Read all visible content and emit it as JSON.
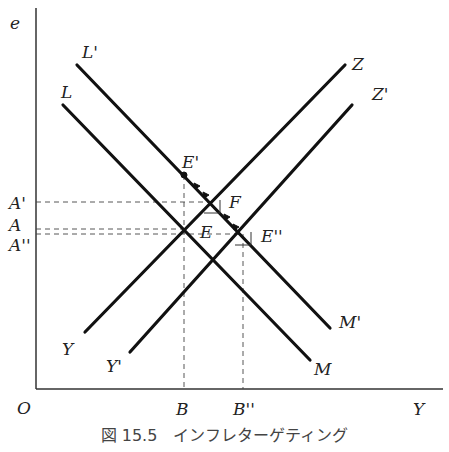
{
  "figure": {
    "caption": "図 15.5　インフレターゲティング",
    "axes": {
      "y_label": "e",
      "x_label": "Y",
      "origin_label": "O"
    },
    "curves": [
      {
        "name": "L",
        "label": "L",
        "end_label": "M",
        "kind": "downward-sloping"
      },
      {
        "name": "L'",
        "label": "L'",
        "end_label": "M'",
        "kind": "downward-sloping"
      },
      {
        "name": "Z",
        "label": "Z",
        "end_label": "Y",
        "kind": "upward-sloping"
      },
      {
        "name": "Z'",
        "label": "Z'",
        "end_label": "Y'",
        "kind": "upward-sloping"
      }
    ],
    "points": {
      "E": "E",
      "E_prime": "E'",
      "F": "F",
      "E_double_prime": "E''"
    },
    "y_ticks": {
      "A_prime": "A'",
      "A": "A",
      "A_double_prime": "A''"
    },
    "x_ticks": {
      "B": "B",
      "B_double_prime": "B''"
    }
  }
}
